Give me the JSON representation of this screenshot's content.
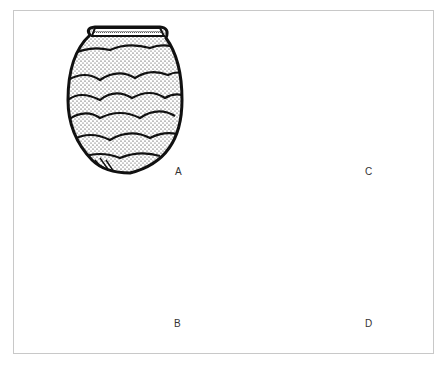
{
  "figure": {
    "frame_color": "#c8c8c8",
    "ink_color": "#111111",
    "vessels": [
      {
        "id": "A",
        "label": "A",
        "form": "ovoid jar with scale/fan-shaped stippled decoration and rolled rim"
      },
      {
        "id": "B",
        "label": "B",
        "form": "pedestal bowl shown half in section, half in stippled exterior"
      },
      {
        "id": "C",
        "label": "C",
        "form": "conical pointed-base jar with horizontal herringbone/cord-impressed rows"
      },
      {
        "id": "D",
        "label": "D",
        "form": "footed vessel fragment with horizontal impressed rows and arched openings in base"
      }
    ]
  }
}
